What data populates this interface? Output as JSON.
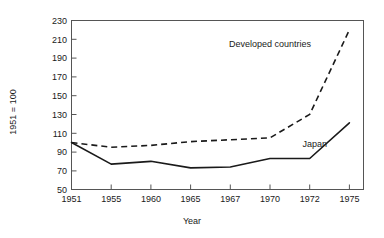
{
  "chart_data": {
    "type": "line",
    "title": "",
    "xlabel": "Year",
    "ylabel": "1951 = 100",
    "x": [
      1951,
      1955,
      1960,
      1965,
      1967,
      1970,
      1972,
      1975
    ],
    "categories": [
      "1951",
      "1955",
      "1960",
      "1965",
      "1967",
      "1970",
      "1972",
      "1975"
    ],
    "xtick_labels": [
      "1951",
      "1955",
      "1960",
      "1965",
      "1967",
      "1970",
      "1972",
      "1975"
    ],
    "ytick_labels": [
      "50",
      "70",
      "90",
      "110",
      "130",
      "150",
      "170",
      "190",
      "210",
      "230"
    ],
    "ytick_values": [
      50,
      70,
      90,
      110,
      130,
      150,
      170,
      190,
      210,
      230
    ],
    "ylim": [
      50,
      230
    ],
    "grid": false,
    "legend_position": "inline-annotation",
    "series": [
      {
        "name": "Developed countries",
        "style": "dashed",
        "values": [
          100,
          95,
          97,
          101,
          103,
          105,
          130,
          220
        ]
      },
      {
        "name": "Japan",
        "style": "solid",
        "values": [
          100,
          77,
          80,
          73,
          74,
          83,
          83,
          121
        ]
      }
    ],
    "annotations": [
      {
        "text": "Developed countries",
        "series": "Developed countries"
      },
      {
        "text": "Japan",
        "series": "Japan"
      }
    ]
  },
  "axis": {
    "y_title": "1951 = 100",
    "x_title": "Year"
  },
  "labels": {
    "developed": "Developed countries",
    "japan": "Japan"
  },
  "colors": {
    "line": "#1a1a1a",
    "frame": "#555555",
    "background": "#ffffff"
  }
}
